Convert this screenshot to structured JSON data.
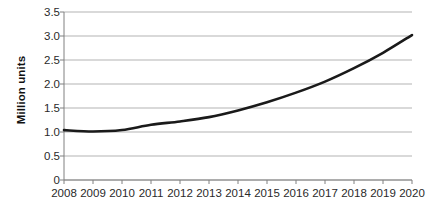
{
  "chart_data": {
    "type": "line",
    "title": "",
    "subtitle": "",
    "xlabel": "",
    "ylabel": "Million units",
    "categories": [
      "2008",
      "2009",
      "2010",
      "2011",
      "2012",
      "2013",
      "2014",
      "2015",
      "2016",
      "2017",
      "2018",
      "2019",
      "2020"
    ],
    "values": [
      1.04,
      1.01,
      1.04,
      1.15,
      1.22,
      1.31,
      1.45,
      1.62,
      1.82,
      2.05,
      2.33,
      2.65,
      3.02
    ],
    "series": [
      {
        "name": "Million units",
        "values": [
          1.04,
          1.01,
          1.04,
          1.15,
          1.22,
          1.31,
          1.45,
          1.62,
          1.82,
          2.05,
          2.33,
          2.65,
          3.02
        ]
      }
    ],
    "ylim": [
      0,
      3.5
    ],
    "y_ticks": [
      0,
      0.5,
      1.0,
      1.5,
      2.0,
      2.5,
      3.0,
      3.5
    ],
    "y_tick_labels": [
      "0",
      "0.5",
      "1.0",
      "1.5",
      "2.0",
      "2.5",
      "3.0",
      "3.5"
    ],
    "grid": "horizontal",
    "legend": "none",
    "line_color": "#1a1a1a",
    "grid_color": "#b3b3b3",
    "axis_color": "#808080",
    "background_color": "#ffffff",
    "smoothing": "curved",
    "annotations": []
  }
}
